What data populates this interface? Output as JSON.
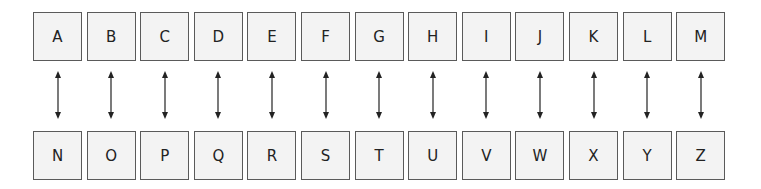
{
  "diagram": {
    "top_row": [
      "A",
      "B",
      "C",
      "D",
      "E",
      "F",
      "G",
      "H",
      "I",
      "J",
      "K",
      "L",
      "M"
    ],
    "bottom_row": [
      "N",
      "O",
      "P",
      "Q",
      "R",
      "S",
      "T",
      "U",
      "V",
      "W",
      "X",
      "Y",
      "Z"
    ],
    "connector": "bidirectional-arrow",
    "colors": {
      "box_fill": "#f3f3f3",
      "box_border": "#5a5a5a",
      "text": "#222222",
      "arrow": "#222222"
    }
  }
}
